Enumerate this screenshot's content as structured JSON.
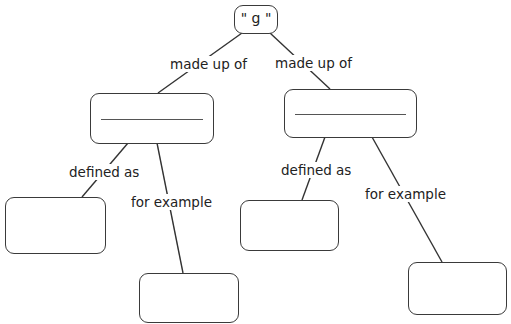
{
  "diagram": {
    "root": {
      "text": "\" g \""
    },
    "left_branch": {
      "link_label": "made up of",
      "node_text": "",
      "children": [
        {
          "link_label": "defined as",
          "node_text": ""
        },
        {
          "link_label": "for example",
          "node_text": ""
        }
      ]
    },
    "right_branch": {
      "link_label": "made up of",
      "node_text": "",
      "children": [
        {
          "link_label": "defined as",
          "node_text": ""
        },
        {
          "link_label": "for example",
          "node_text": ""
        }
      ]
    }
  }
}
